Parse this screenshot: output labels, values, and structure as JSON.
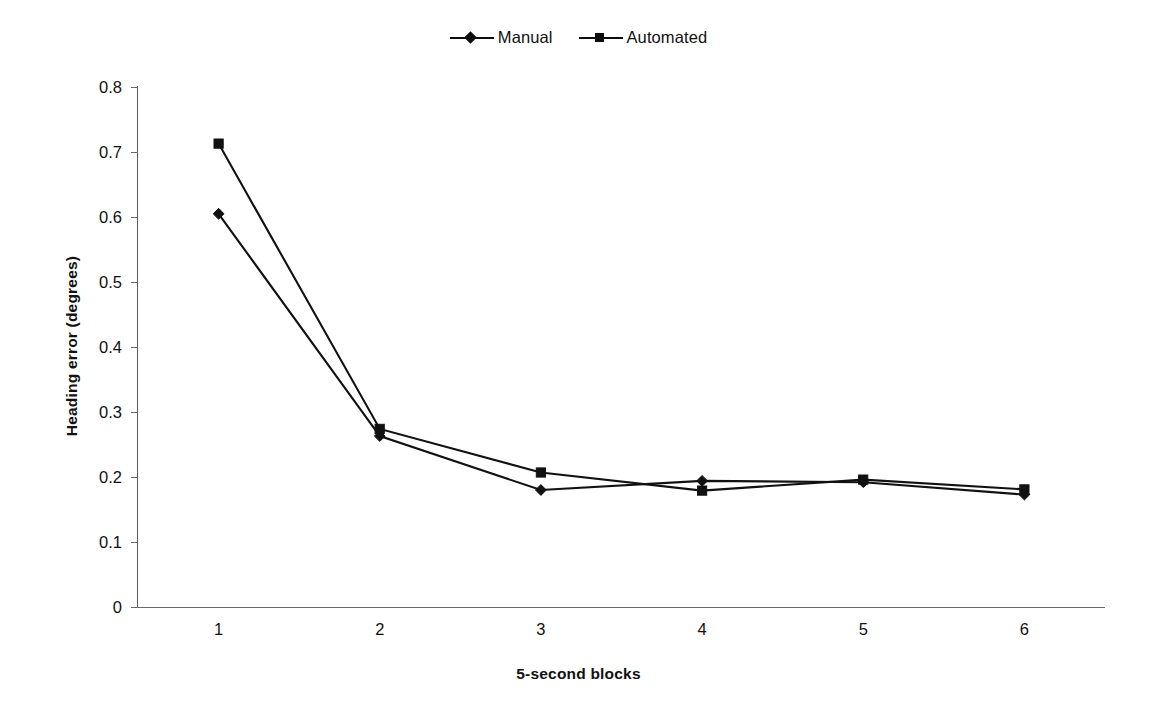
{
  "chart_data": {
    "type": "line",
    "title": "",
    "xlabel": "5-second blocks",
    "ylabel": "Heading error (degrees)",
    "x": [
      1,
      2,
      3,
      4,
      5,
      6
    ],
    "categories": [
      "1",
      "2",
      "3",
      "4",
      "5",
      "6"
    ],
    "xtick_labels": [
      "1",
      "2",
      "3",
      "4",
      "5",
      "6"
    ],
    "ytick_labels": [
      "0.8",
      "0.7",
      "0.6",
      "0.5",
      "0.4",
      "0.3",
      "0.2",
      "0.1",
      "0"
    ],
    "ytick_values": [
      0.8,
      0.7,
      0.6,
      0.5,
      0.4,
      0.3,
      0.2,
      0.1,
      0
    ],
    "ylim": [
      0,
      0.8
    ],
    "xlim": [
      0.5,
      6.5
    ],
    "grid": false,
    "legend_position": "top-center",
    "series": [
      {
        "name": "Manual",
        "marker": "diamond",
        "color": "#111111",
        "values": [
          0.605,
          0.263,
          0.18,
          0.194,
          0.192,
          0.173
        ]
      },
      {
        "name": "Automated",
        "marker": "square",
        "color": "#111111",
        "values": [
          0.713,
          0.274,
          0.207,
          0.179,
          0.196,
          0.181
        ]
      }
    ]
  },
  "legend": {
    "entries": [
      {
        "label": "Manual",
        "marker": "diamond-marker"
      },
      {
        "label": "Automated",
        "marker": "square-marker"
      }
    ]
  },
  "axes": {
    "x_title": "5-second blocks",
    "y_title": "Heading error (degrees)"
  }
}
